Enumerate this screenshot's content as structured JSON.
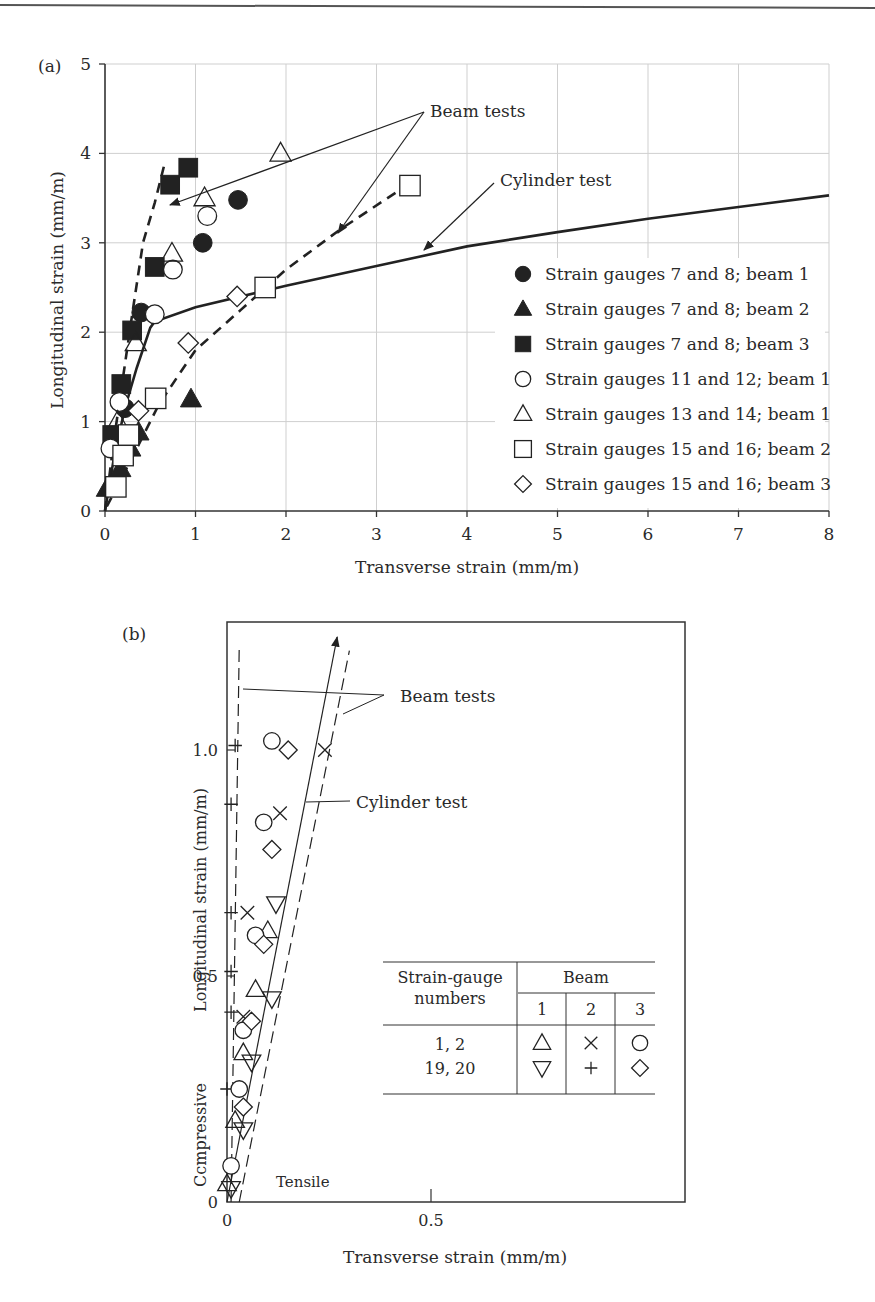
{
  "page": {
    "top_rule": true
  },
  "chart_data": [
    {
      "panel": "(a)",
      "type": "scatter",
      "title": "",
      "xlabel": "Transverse strain (mm/m)",
      "ylabel": "Longitudinal strain (mm/m)",
      "xlim": [
        0,
        8
      ],
      "ylim": [
        0,
        5
      ],
      "xticks": [
        "0",
        "1",
        "2",
        "3",
        "4",
        "5",
        "6",
        "7",
        "8"
      ],
      "yticks": [
        "0",
        "1",
        "2",
        "3",
        "4",
        "5"
      ],
      "grid": true,
      "legend_position": "lower right (inside)",
      "series": [
        {
          "name": "Strain gauges 7 and 8; beam 1",
          "marker": "filled-circle",
          "points": [
            [
              0.22,
              1.15
            ],
            [
              0.4,
              2.22
            ],
            [
              1.08,
              3.0
            ],
            [
              1.47,
              3.48
            ]
          ]
        },
        {
          "name": "Strain gauges 7 and 8; beam 2",
          "marker": "filled-triangle",
          "points": [
            [
              0.02,
              0.25
            ],
            [
              0.17,
              0.47
            ],
            [
              0.28,
              0.7
            ],
            [
              0.37,
              0.88
            ],
            [
              0.95,
              1.25
            ]
          ]
        },
        {
          "name": "Strain gauges 7 and 8; beam 3",
          "marker": "filled-square",
          "points": [
            [
              0.08,
              0.85
            ],
            [
              0.18,
              1.42
            ],
            [
              0.3,
              2.02
            ],
            [
              0.55,
              2.73
            ],
            [
              0.72,
              3.65
            ],
            [
              0.92,
              3.84
            ]
          ]
        },
        {
          "name": "Strain gauges 11 and 12; beam 1",
          "marker": "open-circle",
          "points": [
            [
              0.06,
              0.7
            ],
            [
              0.16,
              1.22
            ],
            [
              0.55,
              2.2
            ],
            [
              0.75,
              2.7
            ],
            [
              1.13,
              3.3
            ]
          ]
        },
        {
          "name": "Strain gauges 13 and 14; beam 1",
          "marker": "open-triangle",
          "points": [
            [
              0.14,
              1.0
            ],
            [
              0.34,
              1.88
            ],
            [
              0.74,
              2.88
            ],
            [
              1.1,
              3.5
            ],
            [
              1.94,
              4.0
            ]
          ]
        },
        {
          "name": "Strain gauges 15 and 16; beam 2",
          "marker": "open-square",
          "points": [
            [
              0.12,
              0.27
            ],
            [
              0.2,
              0.62
            ],
            [
              0.26,
              0.85
            ],
            [
              0.56,
              1.26
            ],
            [
              1.77,
              2.5
            ],
            [
              3.37,
              3.64
            ]
          ]
        },
        {
          "name": "Strain gauges 15 and 16; beam 3",
          "marker": "open-diamond",
          "points": [
            [
              0.37,
              1.12
            ],
            [
              0.92,
              1.88
            ],
            [
              1.46,
              2.4
            ]
          ]
        }
      ],
      "curves": [
        {
          "name": "Cylinder test",
          "style": "solid",
          "points": [
            [
              0,
              0
            ],
            [
              0.1,
              0.6
            ],
            [
              0.22,
              1.15
            ],
            [
              0.35,
              1.6
            ],
            [
              0.5,
              2.05
            ],
            [
              0.55,
              2.12
            ],
            [
              1.0,
              2.28
            ],
            [
              2.0,
              2.52
            ],
            [
              3.0,
              2.74
            ],
            [
              4.0,
              2.96
            ],
            [
              5.0,
              3.12
            ],
            [
              6.0,
              3.27
            ],
            [
              7.0,
              3.4
            ],
            [
              8.0,
              3.53
            ]
          ]
        },
        {
          "name": "Beam tests (steep)",
          "style": "dashed",
          "points": [
            [
              0,
              0
            ],
            [
              0.1,
              0.8
            ],
            [
              0.2,
              1.5
            ],
            [
              0.3,
              2.2
            ],
            [
              0.42,
              3.0
            ],
            [
              0.55,
              3.45
            ],
            [
              0.65,
              3.85
            ]
          ]
        },
        {
          "name": "Beam tests (shallow)",
          "style": "dashed",
          "points": [
            [
              0.02,
              0.05
            ],
            [
              0.3,
              0.6
            ],
            [
              0.6,
              1.2
            ],
            [
              1.0,
              1.8
            ],
            [
              1.5,
              2.25
            ],
            [
              2.0,
              2.7
            ],
            [
              2.6,
              3.15
            ],
            [
              3.3,
              3.62
            ]
          ]
        }
      ],
      "annotations": [
        {
          "text": "Beam tests",
          "anchor": [
            3.6,
            4.45
          ],
          "arrows_to": [
            [
              0.7,
              3.42
            ],
            [
              2.6,
              3.15
            ]
          ]
        },
        {
          "text": "Cylinder test",
          "anchor": [
            4.4,
            3.65
          ],
          "arrows_to": [
            [
              3.5,
              2.85
            ]
          ]
        }
      ]
    },
    {
      "panel": "(b)",
      "type": "scatter",
      "title": "",
      "xlabel": "Transverse strain (mm/m)",
      "ylabel": "Longitudinal strain (mm/m)",
      "xlim": [
        0,
        1.12
      ],
      "ylim": [
        0,
        1.28
      ],
      "xticks": [
        "0",
        "0.5"
      ],
      "yticks": [
        "0",
        "0.5",
        "1.0"
      ],
      "grid": false,
      "side_labels": {
        "compressive": "Ccmpressive",
        "tensile": "Tensile"
      },
      "series": [
        {
          "name": "Beam 1, gauges 1,2",
          "marker": "triangle-up",
          "points": [
            [
              0.0,
              0.04
            ],
            [
              0.02,
              0.18
            ],
            [
              0.04,
              0.33
            ],
            [
              0.07,
              0.47
            ],
            [
              0.1,
              0.6
            ]
          ]
        },
        {
          "name": "Beam 1, gauges 19,20",
          "marker": "triangle-down",
          "points": [
            [
              0.01,
              0.03
            ],
            [
              0.04,
              0.16
            ],
            [
              0.06,
              0.31
            ],
            [
              0.11,
              0.45
            ],
            [
              0.12,
              0.66
            ]
          ]
        },
        {
          "name": "Beam 2, gauges 1,2",
          "marker": "cross-x",
          "points": [
            [
              0.04,
              0.41
            ],
            [
              0.05,
              0.64
            ],
            [
              0.13,
              0.86
            ],
            [
              0.24,
              1.0
            ]
          ]
        },
        {
          "name": "Beam 2, gauges 19,20",
          "marker": "plus",
          "points": [
            [
              0.0,
              0.25
            ],
            [
              0.01,
              0.42
            ],
            [
              0.01,
              0.51
            ],
            [
              0.01,
              0.64
            ],
            [
              0.01,
              0.88
            ],
            [
              0.02,
              1.01
            ]
          ]
        },
        {
          "name": "Beam 3, gauges 1,2",
          "marker": "circle",
          "points": [
            [
              0.01,
              0.08
            ],
            [
              0.03,
              0.25
            ],
            [
              0.04,
              0.38
            ],
            [
              0.07,
              0.59
            ],
            [
              0.09,
              0.84
            ],
            [
              0.11,
              1.02
            ]
          ]
        },
        {
          "name": "Beam 3, gauges 19,20",
          "marker": "diamond",
          "points": [
            [
              0.04,
              0.21
            ],
            [
              0.06,
              0.4
            ],
            [
              0.09,
              0.57
            ],
            [
              0.11,
              0.78
            ],
            [
              0.15,
              1.0
            ]
          ]
        }
      ],
      "curves": [
        {
          "name": "Beam tests (left, near vertical)",
          "style": "dashed",
          "points": [
            [
              0.01,
              0.0
            ],
            [
              0.03,
              1.23
            ]
          ]
        },
        {
          "name": "Cylinder test",
          "style": "solid-arrow",
          "points": [
            [
              0.0,
              0.0
            ],
            [
              0.27,
              1.25
            ]
          ]
        },
        {
          "name": "Beam tests (right)",
          "style": "dashed",
          "points": [
            [
              0.03,
              0.0
            ],
            [
              0.3,
              1.22
            ]
          ]
        }
      ],
      "annotations": [
        {
          "text": "Beam tests",
          "anchor": [
            0.49,
            1.14
          ]
        },
        {
          "text": "Cylinder test",
          "anchor": [
            0.3,
            0.86
          ]
        }
      ],
      "inset_table": {
        "header_col": "Strain-gauge numbers",
        "header_group": "Beam",
        "beam_numbers": [
          "1",
          "2",
          "3"
        ],
        "rows": [
          {
            "gauges": "1, 2",
            "symbols": [
              "△",
              "×",
              "○"
            ]
          },
          {
            "gauges": "19, 20",
            "symbols": [
              "▽",
              "+",
              "◇"
            ]
          }
        ]
      }
    }
  ],
  "labels": {
    "a": {
      "panel": "(a)",
      "xlabel": "Transverse strain (mm/m)",
      "ylabel": "Longitudinal strain (mm/m)",
      "xticks": [
        "0",
        "1",
        "2",
        "3",
        "4",
        "5",
        "6",
        "7",
        "8"
      ],
      "yticks": [
        "0",
        "1",
        "2",
        "3",
        "4",
        "5"
      ],
      "beam_tests": "Beam tests",
      "cylinder_test": "Cylinder test",
      "legend": [
        "Strain gauges 7 and 8; beam 1",
        "Strain gauges 7 and 8; beam 2",
        "Strain gauges 7 and 8; beam 3",
        "Strain gauges 11 and 12; beam 1",
        "Strain gauges 13 and 14; beam 1",
        "Strain gauges 15 and 16; beam 2",
        "Strain gauges 15 and 16; beam 3"
      ]
    },
    "b": {
      "panel": "(b)",
      "xlabel": "Transverse strain (mm/m)",
      "ylabel": "Longitudinal strain (mm/m)",
      "compressive": "Ccmpressive",
      "tensile": "Tensile",
      "xticks": [
        "0",
        "0.5"
      ],
      "yticks": [
        "0",
        "0.5",
        "1.0"
      ],
      "beam_tests": "Beam tests",
      "cylinder_test": "Cylinder test",
      "table": {
        "col_header_1": "Strain-gauge",
        "col_header_2": "numbers",
        "group_header": "Beam",
        "beams": [
          "1",
          "2",
          "3"
        ],
        "row1_gauges": "1, 2",
        "row2_gauges": "19, 20",
        "row1_symbols": [
          "△",
          "×",
          "○"
        ],
        "row2_symbols": [
          "▽",
          "+",
          "◇"
        ]
      }
    }
  },
  "colors": {
    "ink": "#222222",
    "grid": "#c8c8c8",
    "rule": "#555555"
  }
}
